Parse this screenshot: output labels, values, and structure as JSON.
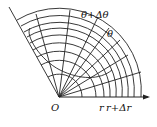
{
  "diagram": {
    "type": "polar-coordinate-grid",
    "origin_label": "O",
    "labels": {
      "theta": "θ",
      "theta_plus": "θ+Δθ",
      "r": "r",
      "r_plus": "r+Δr"
    },
    "colors": {
      "stroke": "#222222",
      "background": "#ffffff"
    }
  }
}
